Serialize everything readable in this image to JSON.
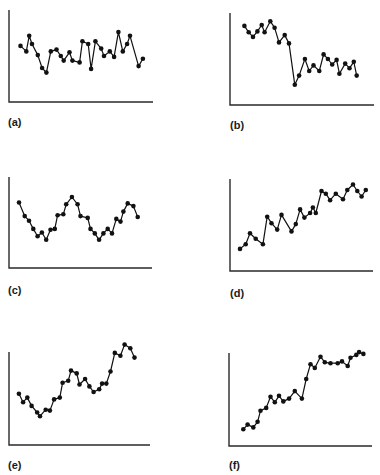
{
  "chart_data": [
    {
      "id": "a",
      "type": "line",
      "label": "(a)",
      "title": "",
      "xlabel": "",
      "ylabel": "",
      "grid": false,
      "description": "stationary noisy series around a constant level",
      "frame": {
        "left": 9,
        "top": 10,
        "width": 144,
        "height": 92
      },
      "label_pos": {
        "left": 8,
        "top": 117
      },
      "ylim": [
        0,
        100
      ],
      "x": [
        8,
        12,
        14,
        16,
        20,
        23,
        26,
        29,
        33,
        36,
        38,
        42,
        44,
        49,
        51,
        55,
        57,
        60,
        64,
        66,
        70,
        73,
        76,
        79,
        82,
        84,
        90,
        93
      ],
      "values": [
        61,
        55,
        72,
        63,
        51,
        37,
        32,
        55,
        57,
        50,
        45,
        54,
        45,
        43,
        66,
        63,
        36,
        66,
        58,
        50,
        55,
        49,
        76,
        55,
        63,
        72,
        39,
        47
      ]
    },
    {
      "id": "b",
      "type": "line",
      "label": "(b)",
      "title": "",
      "xlabel": "",
      "ylabel": "",
      "grid": false,
      "description": "level shift: high level then abrupt drop to lower level",
      "frame": {
        "left": 230,
        "top": 13,
        "width": 144,
        "height": 92
      },
      "label_pos": {
        "left": 230,
        "top": 120
      },
      "ylim": [
        0,
        100
      ],
      "x": [
        10,
        13,
        16,
        19,
        22,
        24,
        28,
        31,
        34,
        38,
        41,
        45,
        48,
        52,
        55,
        58,
        62,
        65,
        68,
        71,
        74,
        76,
        80,
        83,
        86,
        88
      ],
      "values": [
        86,
        79,
        74,
        80,
        87,
        79,
        91,
        84,
        68,
        76,
        67,
        22,
        32,
        50,
        37,
        43,
        37,
        55,
        50,
        44,
        49,
        34,
        45,
        40,
        47,
        32
      ]
    },
    {
      "id": "c",
      "type": "line",
      "label": "(c)",
      "title": "",
      "xlabel": "",
      "ylabel": "",
      "grid": false,
      "description": "cyclical / seasonal oscillation",
      "frame": {
        "left": 9,
        "top": 177,
        "width": 143,
        "height": 91
      },
      "label_pos": {
        "left": 8,
        "top": 285
      },
      "ylim": [
        0,
        100
      ],
      "x": [
        7,
        11,
        14,
        17,
        20,
        23,
        26,
        29,
        32,
        34,
        38,
        40,
        44,
        48,
        50,
        55,
        57,
        60,
        63,
        66,
        69,
        72,
        75,
        78,
        80,
        83,
        87,
        90
      ],
      "values": [
        72,
        57,
        52,
        43,
        35,
        39,
        31,
        42,
        43,
        58,
        59,
        70,
        78,
        70,
        57,
        55,
        43,
        38,
        31,
        38,
        43,
        38,
        54,
        51,
        62,
        71,
        68,
        56
      ]
    },
    {
      "id": "d",
      "type": "line",
      "label": "(d)",
      "title": "",
      "xlabel": "",
      "ylabel": "",
      "grid": false,
      "description": "upward linear trend with noise",
      "frame": {
        "left": 230,
        "top": 179,
        "width": 143,
        "height": 92
      },
      "label_pos": {
        "left": 230,
        "top": 288
      },
      "ylim": [
        0,
        100
      ],
      "x": [
        7,
        11,
        14,
        18,
        23,
        26,
        29,
        33,
        36,
        43,
        46,
        49,
        52,
        56,
        58,
        60,
        64,
        67,
        70,
        74,
        79,
        82,
        86,
        89,
        92,
        95
      ],
      "values": [
        24,
        29,
        41,
        35,
        29,
        59,
        52,
        45,
        61,
        43,
        51,
        67,
        58,
        63,
        69,
        63,
        87,
        84,
        77,
        84,
        78,
        88,
        94,
        87,
        81,
        88
      ]
    },
    {
      "id": "e",
      "type": "line",
      "label": "(e)",
      "title": "",
      "xlabel": "",
      "ylabel": "",
      "grid": false,
      "description": "upward trend combined with cyclical variation",
      "frame": {
        "left": 9,
        "top": 352,
        "width": 141,
        "height": 93
      },
      "label_pos": {
        "left": 8,
        "top": 460
      },
      "ylim": [
        0,
        100
      ],
      "x": [
        7,
        10,
        13,
        16,
        20,
        22,
        26,
        29,
        32,
        36,
        38,
        42,
        44,
        48,
        50,
        54,
        57,
        60,
        64,
        66,
        69,
        72,
        75,
        79,
        82,
        86,
        89
      ],
      "values": [
        55,
        46,
        51,
        42,
        35,
        31,
        38,
        37,
        49,
        51,
        67,
        69,
        80,
        77,
        65,
        71,
        63,
        57,
        60,
        66,
        66,
        79,
        99,
        96,
        108,
        104,
        94
      ]
    },
    {
      "id": "f",
      "type": "line",
      "label": "(f)",
      "title": "",
      "xlabel": "",
      "ylabel": "",
      "grid": false,
      "description": "upward trend that levels off (saturation)",
      "frame": {
        "left": 229,
        "top": 353,
        "width": 143,
        "height": 93
      },
      "label_pos": {
        "left": 229,
        "top": 460
      },
      "ylim": [
        0,
        100
      ],
      "x": [
        10,
        13,
        17,
        20,
        22,
        26,
        29,
        32,
        35,
        38,
        42,
        46,
        51,
        54,
        57,
        60,
        64,
        67,
        71,
        76,
        79,
        83,
        85,
        89,
        91,
        94
      ],
      "values": [
        18,
        23,
        20,
        26,
        38,
        41,
        53,
        47,
        54,
        48,
        51,
        59,
        51,
        72,
        88,
        84,
        96,
        90,
        89,
        89,
        91,
        86,
        95,
        98,
        101,
        99
      ]
    }
  ],
  "panels": {
    "a": {
      "label": "(a)"
    },
    "b": {
      "label": "(b)"
    },
    "c": {
      "label": "(c)"
    },
    "d": {
      "label": "(d)"
    },
    "e": {
      "label": "(e)"
    },
    "f": {
      "label": "(f)"
    }
  },
  "colors": {
    "line": "#111111",
    "axis": "#2a2a2a",
    "background": "#ffffff"
  }
}
